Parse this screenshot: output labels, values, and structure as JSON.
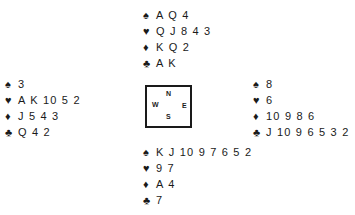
{
  "suits": {
    "spades": "♠",
    "hearts": "♥",
    "diamonds": "♦",
    "clubs": "♣"
  },
  "compass": {
    "north": "N",
    "south": "S",
    "west": "W",
    "east": "E"
  },
  "hands": {
    "north": {
      "spades": "A Q 4",
      "hearts": "Q J 8 4 3",
      "diamonds": "K Q 2",
      "clubs": "A K"
    },
    "west": {
      "spades": "3",
      "hearts": "A K 10 5 2",
      "diamonds": "J 5 4 3",
      "clubs": "Q 4 2"
    },
    "east": {
      "spades": "8",
      "hearts": "6",
      "diamonds": "10 9 8 6",
      "clubs": "J 10 9 6 5 3 2"
    },
    "south": {
      "spades": "K J 10 9 7 6 5 2",
      "hearts": "9 7",
      "diamonds": "A 4",
      "clubs": "7"
    }
  }
}
